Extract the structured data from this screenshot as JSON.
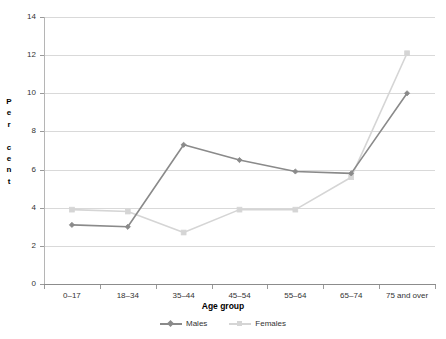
{
  "chart_data": {
    "type": "line",
    "title": "",
    "xlabel": "Age group",
    "ylabel": "Per cent",
    "categories": [
      "0–17",
      "18–34",
      "35–44",
      "45–54",
      "55–64",
      "65–74",
      "75 and over"
    ],
    "series": [
      {
        "name": "Males",
        "values": [
          3.1,
          3.0,
          7.3,
          6.5,
          5.9,
          5.8,
          10.0
        ],
        "color": "#8a8a8a",
        "marker": "diamond"
      },
      {
        "name": "Females",
        "values": [
          3.9,
          3.8,
          2.7,
          3.9,
          3.9,
          5.6,
          12.1
        ],
        "color": "#d5d5d5",
        "marker": "square"
      }
    ],
    "ylim": [
      0,
      14
    ],
    "yticks": [
      0,
      2,
      4,
      6,
      8,
      10,
      12,
      14
    ],
    "ytick_labels": [
      "0",
      "2",
      "4",
      "6",
      "8",
      "10",
      "12",
      "14"
    ],
    "grid": true,
    "legend_position": "bottom",
    "legend_entries": [
      "Males",
      "Females"
    ]
  },
  "axis": {
    "y_title_letters": [
      "P",
      "e",
      "r",
      "",
      "c",
      "e",
      "n",
      "t"
    ],
    "x_title": "Age group"
  },
  "colors": {
    "males": "#8a8a8a",
    "females": "#d5d5d5",
    "grid": "#d9d9d9",
    "axis": "#8c8c8c",
    "text": "#333333",
    "background": "#ffffff"
  }
}
